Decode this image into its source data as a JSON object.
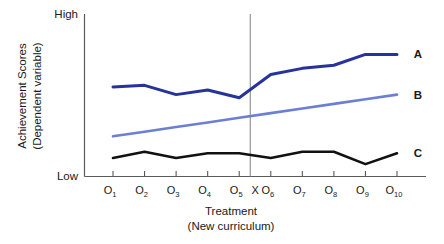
{
  "chart_data": {
    "type": "line",
    "title": "",
    "subtitle": "",
    "xlabel": "Treatment",
    "xlabel_sub": "(New curriculum)",
    "ylabel": "Achievement Scores",
    "ylabel_sub": "(Dependent variable)",
    "grid": false,
    "legend_position": "right-inline",
    "ylim": [
      0,
      100
    ],
    "y_tick_labels": [
      "High",
      "Low"
    ],
    "x_axis_kind": "ordinal-observations",
    "categories": [
      "O1",
      "O2",
      "O3",
      "O4",
      "O5",
      "O6",
      "O7",
      "O8",
      "O9",
      "O10"
    ],
    "category_labels": [
      {
        "base": "O",
        "sub": "1"
      },
      {
        "base": "O",
        "sub": "2"
      },
      {
        "base": "O",
        "sub": "3"
      },
      {
        "base": "O",
        "sub": "4"
      },
      {
        "base": "O",
        "sub": "5"
      },
      {
        "base": "O",
        "sub": "6"
      },
      {
        "base": "O",
        "sub": "7"
      },
      {
        "base": "O",
        "sub": "8"
      },
      {
        "base": "O",
        "sub": "9"
      },
      {
        "base": "O",
        "sub": "10"
      }
    ],
    "intervention": {
      "label": "X",
      "between": [
        "O5",
        "O6"
      ],
      "position_index": 5.35,
      "line_style": "solid-thin-gray",
      "line_color": "#8c8c8c"
    },
    "series": [
      {
        "name": "A",
        "label": "A",
        "color": "#27339b",
        "width": 3.0,
        "values": [
          58,
          59,
          53,
          56,
          51,
          66,
          70,
          72,
          79,
          79
        ]
      },
      {
        "name": "B",
        "label": "B",
        "color": "#6c7fd4",
        "width": 2.6,
        "values": [
          26,
          29,
          32,
          35,
          38,
          41,
          44,
          47,
          50,
          53
        ]
      },
      {
        "name": "C",
        "label": "C",
        "color": "#111111",
        "width": 2.6,
        "values": [
          12,
          16,
          12,
          15,
          15,
          12,
          16,
          16,
          8,
          15
        ]
      }
    ]
  },
  "axes": {
    "y_high_label": "High",
    "y_low_label": "Low",
    "y_title_line1": "Achievement Scores",
    "y_title_line2": "(Dependent variable)",
    "x_title_line1": "Treatment",
    "x_title_line2": "(New curriculum)"
  }
}
